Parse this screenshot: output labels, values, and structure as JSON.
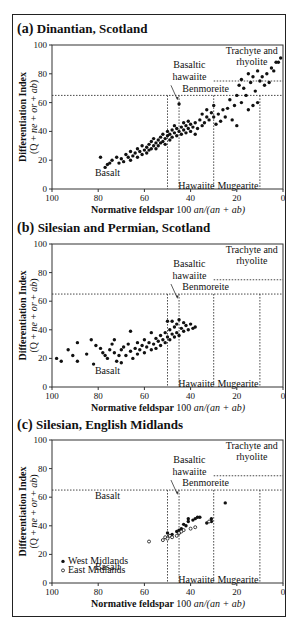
{
  "chart_data": [
    {
      "type": "scatter",
      "panel_label": "(a)",
      "title": "Dinantian, Scotland",
      "xlabel": "Normative feldspar  100 an/(an + ab)",
      "ylabel": "Differentiation Index",
      "ylabel2": "(Q + ne + or + ab)",
      "xlim": [
        100,
        0
      ],
      "ylim": [
        0,
        100
      ],
      "xticks": [
        100,
        80,
        60,
        40,
        20,
        0
      ],
      "yticks": [
        0,
        20,
        40,
        60,
        80,
        100
      ],
      "region_labels": [
        "Basalt",
        "Basaltic hawaiite",
        "Benmoreite",
        "Hawaiite",
        "Mugearite",
        "Trachyte and rhyolite"
      ],
      "series": [
        {
          "name": "Dinantian lavas",
          "marker": "filled",
          "points": [
            [
              79,
              22
            ],
            [
              77,
              15
            ],
            [
              76,
              17
            ],
            [
              75,
              18
            ],
            [
              74,
              20
            ],
            [
              72,
              22
            ],
            [
              71,
              18
            ],
            [
              70,
              21
            ],
            [
              69,
              19
            ],
            [
              68,
              24
            ],
            [
              67,
              22
            ],
            [
              66,
              20
            ],
            [
              66,
              26
            ],
            [
              65,
              23
            ],
            [
              64,
              25
            ],
            [
              63,
              22
            ],
            [
              63,
              28
            ],
            [
              62,
              26
            ],
            [
              61,
              24
            ],
            [
              61,
              30
            ],
            [
              60,
              27
            ],
            [
              59,
              29
            ],
            [
              59,
              25
            ],
            [
              58,
              31
            ],
            [
              58,
              27
            ],
            [
              57,
              33
            ],
            [
              57,
              28
            ],
            [
              56,
              30
            ],
            [
              56,
              35
            ],
            [
              55,
              32
            ],
            [
              55,
              28
            ],
            [
              54,
              34
            ],
            [
              54,
              30
            ],
            [
              53,
              36
            ],
            [
              53,
              32
            ],
            [
              52,
              33
            ],
            [
              52,
              38
            ],
            [
              51,
              35
            ],
            [
              51,
              31
            ],
            [
              50,
              37
            ],
            [
              50,
              40
            ],
            [
              49,
              34
            ],
            [
              49,
              38
            ],
            [
              48,
              36
            ],
            [
              48,
              41
            ],
            [
              47,
              39
            ],
            [
              47,
              44
            ],
            [
              46,
              37
            ],
            [
              46,
              42
            ],
            [
              45,
              40
            ],
            [
              45,
              59
            ],
            [
              44,
              38
            ],
            [
              44,
              43
            ],
            [
              43,
              41
            ],
            [
              43,
              46
            ],
            [
              42,
              39
            ],
            [
              42,
              44
            ],
            [
              41,
              42
            ],
            [
              41,
              47
            ],
            [
              40,
              40
            ],
            [
              40,
              45
            ],
            [
              39,
              43
            ],
            [
              38,
              38
            ],
            [
              38,
              46
            ],
            [
              37,
              42
            ],
            [
              36,
              48
            ],
            [
              35,
              44
            ],
            [
              35,
              52
            ],
            [
              34,
              46
            ],
            [
              33,
              50
            ],
            [
              33,
              55
            ],
            [
              32,
              48
            ],
            [
              31,
              53
            ],
            [
              30,
              50
            ],
            [
              30,
              58
            ],
            [
              29,
              45
            ],
            [
              28,
              52
            ],
            [
              27,
              47
            ],
            [
              26,
              55
            ],
            [
              25,
              50
            ],
            [
              24,
              56
            ],
            [
              23,
              62
            ],
            [
              22,
              48
            ],
            [
              21,
              58
            ],
            [
              20,
              44
            ],
            [
              20,
              65
            ],
            [
              19,
              72
            ],
            [
              18,
              76
            ],
            [
              18,
              60
            ],
            [
              17,
              70
            ],
            [
              16,
              65
            ],
            [
              15,
              80
            ],
            [
              15,
              55
            ],
            [
              14,
              74
            ],
            [
              13,
              78
            ],
            [
              13,
              58
            ],
            [
              12,
              68
            ],
            [
              11,
              82
            ],
            [
              11,
              60
            ],
            [
              10,
              75
            ],
            [
              9,
              78
            ],
            [
              8,
              72
            ],
            [
              7,
              80
            ],
            [
              6,
              74
            ],
            [
              5,
              84
            ],
            [
              4,
              82
            ],
            [
              3,
              88
            ],
            [
              2,
              88
            ],
            [
              1,
              91
            ]
          ]
        }
      ]
    },
    {
      "type": "scatter",
      "panel_label": "(b)",
      "title": "Silesian and Permian, Scotland",
      "xlabel": "Normative feldspar  100 an/(an + ab)",
      "ylabel": "Differentiation Index",
      "ylabel2": "(Q + ne + or + ab)",
      "xlim": [
        100,
        0
      ],
      "ylim": [
        0,
        100
      ],
      "xticks": [
        100,
        80,
        60,
        40,
        20,
        0
      ],
      "yticks": [
        0,
        20,
        40,
        60,
        80,
        100
      ],
      "region_labels": [
        "Basalt",
        "Basaltic hawaiite",
        "Benmoreite",
        "Hawaiite",
        "Mugearite",
        "Trachyte and rhyolite"
      ],
      "series": [
        {
          "name": "Silesian and Permian lavas",
          "marker": "filled",
          "points": [
            [
              98,
              20
            ],
            [
              96,
              18
            ],
            [
              93,
              26
            ],
            [
              91,
              22
            ],
            [
              89,
              31
            ],
            [
              89,
              18
            ],
            [
              85,
              23
            ],
            [
              83,
              33
            ],
            [
              82,
              16
            ],
            [
              81,
              29
            ],
            [
              79,
              27
            ],
            [
              78,
              24
            ],
            [
              77,
              22
            ],
            [
              76,
              20
            ],
            [
              75,
              26
            ],
            [
              74,
              30
            ],
            [
              73,
              24
            ],
            [
              73,
              33
            ],
            [
              72,
              18
            ],
            [
              71,
              22
            ],
            [
              70,
              26
            ],
            [
              70,
              17
            ],
            [
              69,
              28
            ],
            [
              68,
              22
            ],
            [
              67,
              30
            ],
            [
              66,
              25
            ],
            [
              66,
              39
            ],
            [
              65,
              20
            ],
            [
              64,
              27
            ],
            [
              63,
              23
            ],
            [
              63,
              31
            ],
            [
              62,
              26
            ],
            [
              61,
              29
            ],
            [
              60,
              24
            ],
            [
              60,
              33
            ],
            [
              59,
              28
            ],
            [
              58,
              31
            ],
            [
              57,
              26
            ],
            [
              57,
              38
            ],
            [
              56,
              30
            ],
            [
              55,
              27
            ],
            [
              55,
              34
            ],
            [
              54,
              32
            ],
            [
              53,
              29
            ],
            [
              53,
              36
            ],
            [
              52,
              33
            ],
            [
              51,
              31
            ],
            [
              51,
              38
            ],
            [
              50,
              35
            ],
            [
              50,
              46
            ],
            [
              49,
              33
            ],
            [
              49,
              40
            ],
            [
              48,
              37
            ],
            [
              48,
              46
            ],
            [
              47,
              35
            ],
            [
              47,
              42
            ],
            [
              46,
              38
            ],
            [
              46,
              44
            ],
            [
              45,
              36
            ],
            [
              45,
              47
            ],
            [
              44,
              41
            ],
            [
              43,
              39
            ],
            [
              43,
              45
            ],
            [
              42,
              43
            ],
            [
              41,
              40
            ],
            [
              40,
              44
            ],
            [
              39,
              41
            ],
            [
              38,
              42
            ]
          ]
        }
      ]
    },
    {
      "type": "scatter",
      "panel_label": "(c)",
      "title": "Silesian, English Midlands",
      "xlabel": "Normative feldspar  100 an/(an + ab)",
      "ylabel": "Differentiation Index",
      "ylabel2": "(Q + ne + or + ab)",
      "xlim": [
        100,
        0
      ],
      "ylim": [
        0,
        100
      ],
      "xticks": [
        100,
        80,
        60,
        40,
        20,
        0
      ],
      "yticks": [
        0,
        20,
        40,
        60,
        80,
        100
      ],
      "region_labels": [
        "Basalt",
        "Basalt",
        "Basaltic hawaiite",
        "Benmoreite",
        "Hawaiite",
        "Mugearite",
        "Trachyte and rhyolite"
      ],
      "legend": [
        {
          "name": "West Midlands",
          "marker": "filled"
        },
        {
          "name": "East Midlands",
          "marker": "open"
        }
      ],
      "series": [
        {
          "name": "West Midlands",
          "marker": "filled",
          "points": [
            [
              50,
              35
            ],
            [
              49,
              33
            ],
            [
              48,
              34
            ],
            [
              46,
              36
            ],
            [
              45,
              37
            ],
            [
              45,
              35
            ],
            [
              44,
              38
            ],
            [
              43,
              41
            ],
            [
              42,
              40
            ],
            [
              41,
              43
            ],
            [
              41,
              45
            ],
            [
              39,
              44
            ],
            [
              38,
              45
            ],
            [
              37,
              46
            ],
            [
              36,
              46
            ],
            [
              33,
              42
            ],
            [
              31,
              43
            ],
            [
              31,
              45
            ],
            [
              25,
              56
            ]
          ]
        },
        {
          "name": "East Midlands",
          "marker": "open",
          "points": [
            [
              58,
              29
            ],
            [
              52,
              30
            ],
            [
              51,
              32
            ],
            [
              50,
              31
            ],
            [
              49,
              33
            ],
            [
              48,
              32
            ],
            [
              46,
              33
            ],
            [
              45,
              35
            ],
            [
              44,
              36
            ],
            [
              43,
              37
            ],
            [
              40,
              38
            ],
            [
              38,
              39
            ],
            [
              32,
              43
            ]
          ]
        }
      ]
    }
  ],
  "figure": {
    "regions": {
      "basalt": "Basalt",
      "basaltic_hawaiite_1": "Basaltic",
      "basaltic_hawaiite_2": "hawaiite",
      "benmoreite": "Benmoreite",
      "hawaiite": "Hawaiite",
      "mugearite": "Mugearite",
      "trachyte_1": "Trachyte and",
      "trachyte_2": "rhyolite"
    },
    "xlabel_main": "Normative feldspar",
    "xlabel_formula": "100 an/(an + ab)",
    "ylabel_1": "Differentiation Index",
    "ylabel_2": "(Q + ne + or + ab)"
  }
}
